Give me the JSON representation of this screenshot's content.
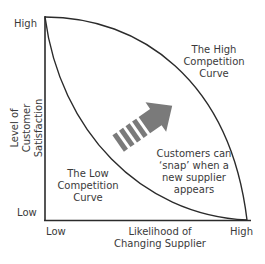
{
  "diagram": {
    "y_axis": {
      "label_line1": "Level of",
      "label_line2": "Customer Satisfaction",
      "high": "High",
      "low": "Low"
    },
    "x_axis": {
      "label_line1": "Likelihood of",
      "label_line2": "Changing Supplier",
      "low": "Low",
      "high": "High"
    },
    "curves": {
      "high_competition": [
        "The High",
        "Competition",
        "Curve"
      ],
      "low_competition": [
        "The Low",
        "Competition",
        "Curve"
      ]
    },
    "annotation": [
      "Customers can",
      "‘snap’ when a",
      "new supplier",
      "appears"
    ],
    "colors": {
      "line": "#2b2b2b",
      "arrow": "#7a7a7a",
      "text": "#3a3a3a"
    }
  }
}
